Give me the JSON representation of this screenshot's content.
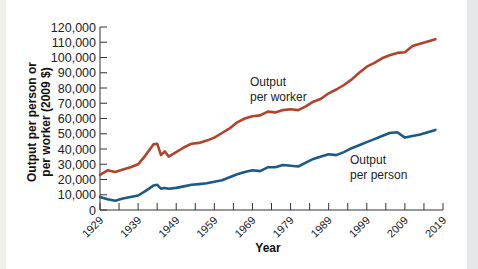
{
  "chart_data": {
    "type": "line",
    "title": "",
    "xlabel": "Year",
    "ylabel": "Output per person or per worker (2009 $)",
    "ylabel_lines": [
      "Output per person or",
      "per worker (2009 $)"
    ],
    "xlim": [
      1929,
      2019
    ],
    "ylim": [
      0,
      120000
    ],
    "grid": false,
    "legend": "none (inline annotations)",
    "x_ticks": [
      1929,
      1939,
      1949,
      1959,
      1969,
      1979,
      1989,
      1999,
      2009,
      2019
    ],
    "x_tick_labels": [
      "1929",
      "1939",
      "1949",
      "1959",
      "1969",
      "1979",
      "1989",
      "1999",
      "2009",
      "2019"
    ],
    "y_ticks": [
      0,
      10000,
      20000,
      30000,
      40000,
      50000,
      60000,
      70000,
      80000,
      90000,
      100000,
      110000,
      120000
    ],
    "y_tick_labels": [
      "0",
      "10,000",
      "20,000",
      "30,000",
      "40,000",
      "50,000",
      "60,000",
      "70,000",
      "80,000",
      "90,000",
      "100,000",
      "110,000",
      "120,000"
    ],
    "x": [
      1929,
      1931,
      1933,
      1935,
      1937,
      1939,
      1941,
      1943,
      1944,
      1945,
      1946,
      1947,
      1949,
      1951,
      1953,
      1955,
      1957,
      1959,
      1961,
      1963,
      1965,
      1967,
      1969,
      1971,
      1973,
      1975,
      1977,
      1979,
      1981,
      1983,
      1985,
      1987,
      1989,
      1991,
      1993,
      1995,
      1997,
      1999,
      2001,
      2003,
      2005,
      2007,
      2009,
      2011,
      2013,
      2015,
      2017
    ],
    "series": [
      {
        "name": "Output per worker",
        "color": "#b0432a",
        "values": [
          23000,
          26000,
          25000,
          26500,
          28000,
          30000,
          36000,
          43000,
          43500,
          36000,
          38500,
          35000,
          38000,
          41000,
          43500,
          44000,
          45500,
          47500,
          50500,
          53500,
          57500,
          60000,
          61500,
          62000,
          64500,
          64000,
          65500,
          66000,
          65500,
          68000,
          71000,
          73000,
          76500,
          79000,
          82000,
          85500,
          90000,
          94000,
          96500,
          99500,
          101500,
          103000,
          103500,
          107500,
          109000,
          110500,
          112000
        ]
      },
      {
        "name": "Output per person",
        "color": "#1b5a86",
        "values": [
          8500,
          7000,
          6000,
          7500,
          8500,
          9500,
          12500,
          16000,
          16500,
          14000,
          14500,
          14000,
          14500,
          15500,
          16500,
          17000,
          17500,
          18500,
          19500,
          21500,
          23500,
          25000,
          26000,
          25500,
          28000,
          28000,
          29500,
          29000,
          28500,
          31000,
          33500,
          35000,
          36500,
          36000,
          38000,
          40500,
          42500,
          44500,
          46500,
          48500,
          50500,
          51000,
          47500,
          48500,
          49500,
          51000,
          52500
        ]
      }
    ],
    "annotations": [
      {
        "text_lines": [
          "Output",
          "per worker"
        ],
        "x": 1965,
        "y": 75000,
        "series": "Output per worker"
      },
      {
        "text_lines": [
          "Output",
          "per person"
        ],
        "x": 1990,
        "y": 30000,
        "series": "Output per person"
      }
    ]
  },
  "labels": {
    "xlabel": "Year",
    "ylabel_line1": "Output per person or",
    "ylabel_line2": "per worker (2009 $)",
    "annot_worker_line1": "Output",
    "annot_worker_line2": "per worker",
    "annot_person_line1": "Output",
    "annot_person_line2": "per person"
  }
}
